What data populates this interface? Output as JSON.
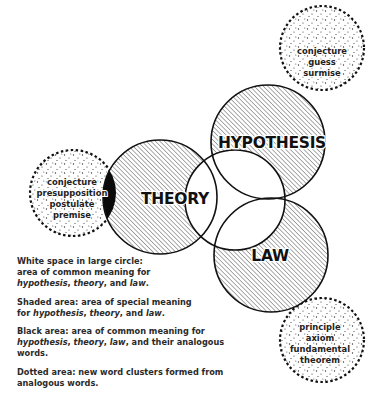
{
  "diagram": {
    "main_circles": [
      {
        "id": "hypothesis",
        "label": "HYPOTHESIS"
      },
      {
        "id": "theory",
        "label": "THEORY"
      },
      {
        "id": "law",
        "label": "LAW"
      }
    ],
    "dotted_clusters": [
      {
        "id": "hypothesis-cluster",
        "words": [
          "conjecture",
          "guess",
          "surmise"
        ]
      },
      {
        "id": "theory-cluster",
        "words": [
          "conjecture",
          "presupposition",
          "postulate",
          "premise"
        ]
      },
      {
        "id": "law-cluster",
        "words": [
          "principle",
          "axiom",
          "fundamental",
          "theorem"
        ]
      }
    ]
  },
  "legend": {
    "white": {
      "lead": "White space in large circle:",
      "line2": "area of common meaning for",
      "terms": [
        "hypothesis",
        "theory",
        "law"
      ],
      "sep1": ", ",
      "sep2": ", and ",
      "end": "."
    },
    "shaded": {
      "lead": "Shaded area: area of special meaning",
      "line2_prefix": "for ",
      "terms": [
        "hypothesis",
        "theory",
        "law"
      ],
      "sep1": ", ",
      "sep2": ", and ",
      "end": "."
    },
    "black": {
      "lead": "Black area: area of common meaning for",
      "terms": [
        "hypothesis",
        "theory",
        "law"
      ],
      "sep": ", ",
      "tail": ", and their analogous words."
    },
    "dotted": {
      "text": "Dotted area: new word clusters formed from analogous words."
    }
  },
  "colors": {
    "ink": "#111111",
    "hatch": "#444444",
    "background": "#ffffff"
  }
}
